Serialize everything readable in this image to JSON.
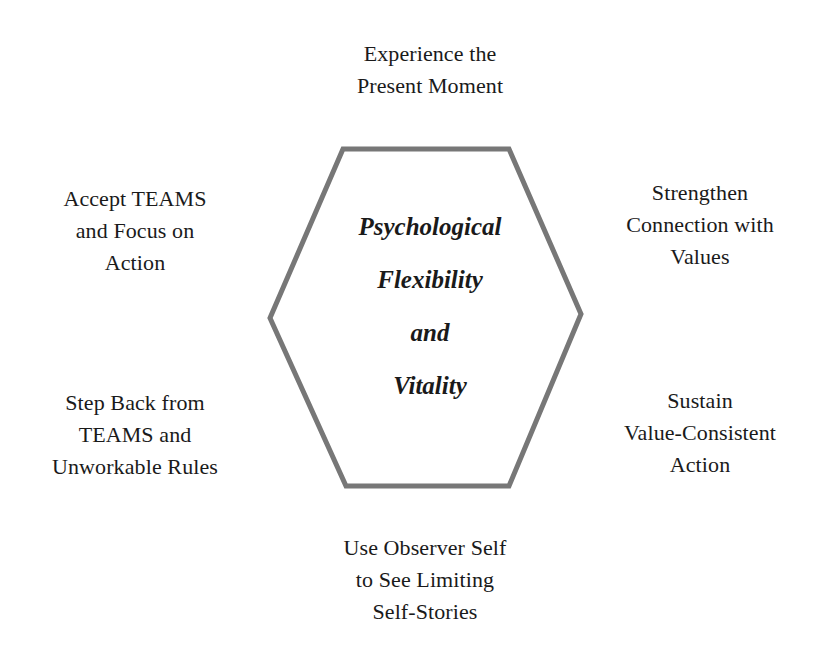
{
  "diagram": {
    "center": {
      "lines": [
        "Psychological",
        "Flexibility",
        "and",
        "Vitality"
      ]
    },
    "nodes": {
      "top": {
        "lines": [
          "Experience the",
          "Present Moment"
        ]
      },
      "top_left": {
        "lines": [
          "Accept TEAMS",
          "and Focus on",
          "Action"
        ]
      },
      "top_right": {
        "lines": [
          "Strengthen",
          "Connection with",
          "Values"
        ]
      },
      "bottom_left": {
        "lines": [
          "Step Back from",
          "TEAMS and",
          "Unworkable Rules"
        ]
      },
      "bottom_right": {
        "lines": [
          "Sustain",
          "Value-Consistent",
          "Action"
        ]
      },
      "bottom": {
        "lines": [
          "Use Observer Self",
          "to See Limiting",
          "Self-Stories"
        ]
      }
    },
    "colors": {
      "hexagon_stroke": "#777777",
      "text": "#1a1a1a",
      "background": "#ffffff"
    }
  }
}
